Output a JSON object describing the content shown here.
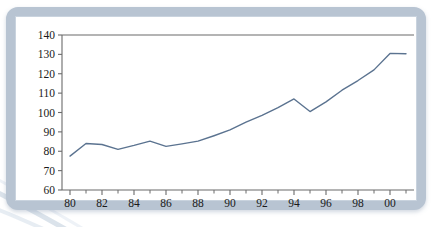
{
  "chart_data": {
    "type": "line",
    "title": "",
    "subtitle": "",
    "xlabel": "",
    "ylabel": "",
    "xlim": [
      1979.5,
      2001.5
    ],
    "ylim": [
      60,
      140
    ],
    "grid": false,
    "legend": null,
    "legend_position": "none",
    "line_color": "#5b7390",
    "axis_color": "#6b6b6b",
    "x_tick_labels": [
      "80",
      "82",
      "84",
      "86",
      "88",
      "90",
      "92",
      "94",
      "96",
      "98",
      "00"
    ],
    "x_tick_values": [
      1980,
      1982,
      1984,
      1986,
      1988,
      1990,
      1992,
      1994,
      1996,
      1998,
      2000
    ],
    "x_minor_tick_values": [
      1981,
      1983,
      1985,
      1987,
      1989,
      1991,
      1993,
      1995,
      1997,
      1999,
      2001
    ],
    "y_tick_labels": [
      "60",
      "70",
      "80",
      "90",
      "100",
      "110",
      "120",
      "130",
      "140"
    ],
    "y_tick_values": [
      60,
      70,
      80,
      90,
      100,
      110,
      120,
      130,
      140
    ],
    "x": [
      1980,
      1981,
      1982,
      1983,
      1984,
      1985,
      1986,
      1987,
      1988,
      1989,
      1990,
      1991,
      1992,
      1993,
      1994,
      1995,
      1996,
      1997,
      1998,
      1999,
      2000,
      2001
    ],
    "values": [
      77.5,
      84.0,
      83.5,
      81.0,
      83.0,
      85.2,
      82.5,
      83.8,
      85.2,
      88.0,
      91.0,
      95.0,
      98.5,
      102.5,
      107.0,
      100.5,
      105.5,
      111.5,
      116.5,
      122.0,
      130.5,
      130.3
    ],
    "series": [
      {
        "name": "series-1",
        "values": [
          77.5,
          84.0,
          83.5,
          81.0,
          83.0,
          85.2,
          82.5,
          83.8,
          85.2,
          88.0,
          91.0,
          95.0,
          98.5,
          102.5,
          107.0,
          100.5,
          105.5,
          111.5,
          116.5,
          122.0,
          130.5,
          130.3
        ]
      }
    ],
    "annotations": []
  },
  "frame": {
    "border_color": "#b8c4d2",
    "background": "#ffffff"
  }
}
